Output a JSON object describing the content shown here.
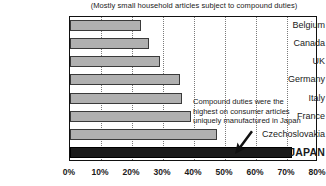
{
  "chart_data": {
    "type": "bar",
    "orientation": "horizontal",
    "title": "",
    "subtitle": "(Mostly small household articles subject to compound duties)",
    "categories": [
      "Belgium",
      "Canada",
      "UK",
      "Germany",
      "Italy",
      "France",
      "Czechoslovakia",
      "JAPAN"
    ],
    "values": [
      23,
      25.5,
      29,
      35.5,
      36,
      39,
      47.5,
      71.5
    ],
    "xlabel": "",
    "ylabel": "",
    "xlim": [
      0,
      80
    ],
    "xticks": [
      "0%",
      "10%",
      "20%",
      "30%",
      "40%",
      "50%",
      "60%",
      "70%",
      "80%"
    ],
    "xtick_values": [
      0,
      10,
      20,
      30,
      40,
      50,
      60,
      70,
      80
    ],
    "grid": "vertical-dotted",
    "legend": "none",
    "highlight_category": "JAPAN",
    "bar_color": "#b0b0b0",
    "highlight_color": "#1b1b1b",
    "annotations": [
      {
        "lines": [
          "Compound duties were the",
          "highest on consumer articles",
          "uniquely manufactured in Japan"
        ],
        "arrow": "arrow-down-left",
        "points_to": "JAPAN"
      }
    ]
  }
}
